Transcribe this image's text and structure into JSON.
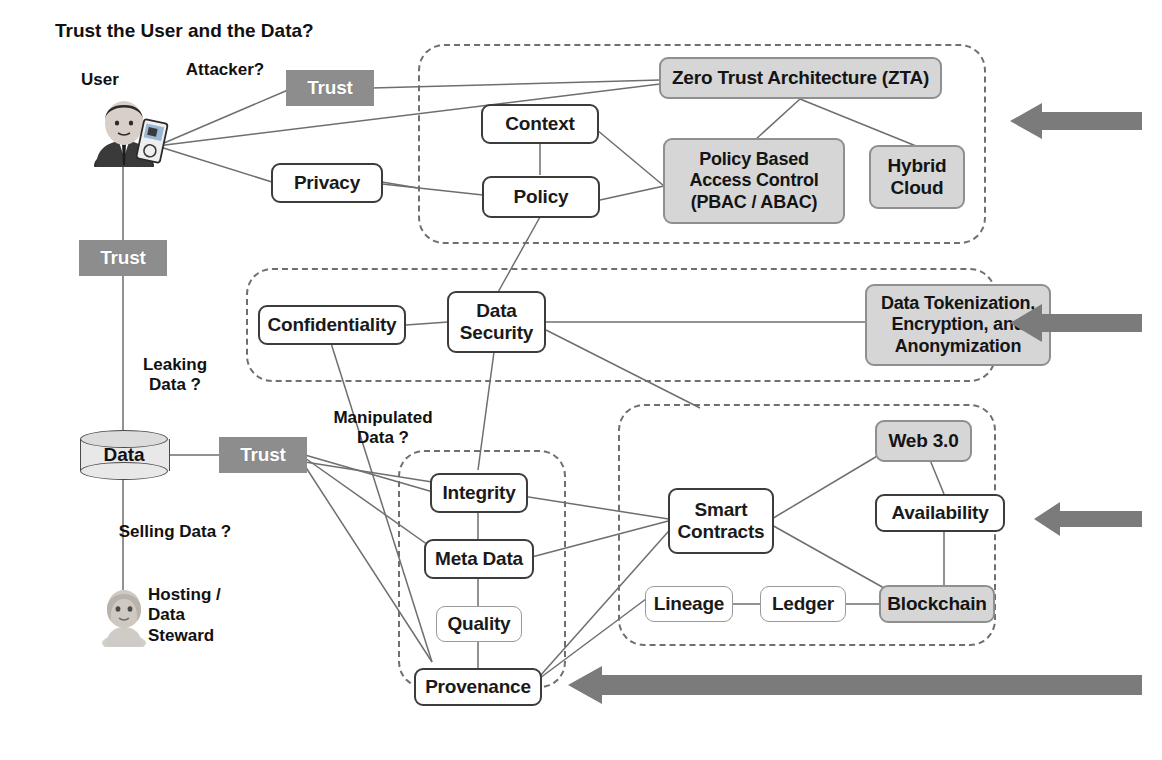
{
  "title": "Trust the User and the Data?",
  "actors": [
    {
      "id": "user",
      "label": "User",
      "icon": "user-avatar-icon"
    },
    {
      "id": "steward",
      "label": "Hosting /\nData\nSteward",
      "icon": "person-avatar-icon"
    }
  ],
  "questions": {
    "attacker": "Attacker?",
    "leaking": "Leaking\nData ?",
    "selling": "Selling Data ?",
    "manipulated": "Manipulated\nData ?"
  },
  "trust_nodes": [
    {
      "id": "trust_user",
      "label": "Trust"
    },
    {
      "id": "trust_mid",
      "label": "Trust"
    },
    {
      "id": "trust_data",
      "label": "Trust"
    }
  ],
  "datastore": {
    "label": "Data"
  },
  "groups": [
    {
      "id": "zta-group",
      "name": "zero-trust-architecture-group"
    },
    {
      "id": "data-security-group",
      "name": "data-security-group"
    },
    {
      "id": "data-quality-group",
      "name": "data-quality-group"
    },
    {
      "id": "web3-group",
      "name": "web3-blockchain-group"
    }
  ],
  "nodes": {
    "context": "Context",
    "privacy": "Privacy",
    "policy": "Policy",
    "zta": "Zero Trust Architecture (ZTA)",
    "pbac": "Policy Based\nAccess Control\n(PBAC / ABAC)",
    "hybrid_cloud": "Hybrid\nCloud",
    "confidentiality": "Confidentiality",
    "data_security": "Data\nSecurity",
    "tokenization": "Data Tokenization,\nEncryption, and\nAnonymization",
    "integrity": "Integrity",
    "meta_data": "Meta Data",
    "quality": "Quality",
    "provenance": "Provenance",
    "smart_contracts": "Smart\nContracts",
    "web3": "Web 3.0",
    "availability": "Availability",
    "lineage": "Lineage",
    "ledger": "Ledger",
    "blockchain": "Blockchain"
  },
  "arrows": [
    {
      "id": "arrow-zta",
      "direction": "left"
    },
    {
      "id": "arrow-data-security",
      "direction": "left"
    },
    {
      "id": "arrow-web3",
      "direction": "left"
    },
    {
      "id": "arrow-provenance",
      "direction": "left"
    }
  ],
  "colors": {
    "trust_fill": "#8d8d8d",
    "grey_node_fill": "#d6d6d6",
    "grey_node_border": "#8f8f8f",
    "white_node_border": "#3c3c3c",
    "dashed_group_border": "#6f6f6f",
    "arrow_fill": "#7b7b7b",
    "text": "#111111",
    "edge_line": "#6e6e6e"
  }
}
